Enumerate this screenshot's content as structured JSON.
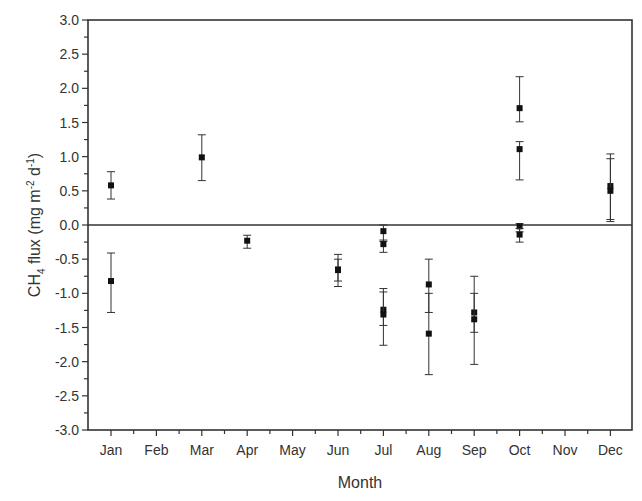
{
  "chart_data": {
    "type": "scatter",
    "title": "",
    "xlabel": "Month",
    "ylabel": "CH4 flux (mg m-2 d-1)",
    "ylabel_parts": {
      "main": "CH",
      "sub": "4",
      "rest": " flux (mg m",
      "sup1": "-2",
      "mid": " d",
      "sup2": "-1",
      "end": ")"
    },
    "categories": [
      "Jan",
      "Feb",
      "Mar",
      "Apr",
      "May",
      "Jun",
      "Jul",
      "Aug",
      "Sep",
      "Oct",
      "Nov",
      "Dec"
    ],
    "ylim": [
      -3.0,
      3.0
    ],
    "yticks": [
      "3.0",
      "2.5",
      "2.0",
      "1.5",
      "1.0",
      "0.5",
      "0.0",
      "-0.5",
      "-1.0",
      "-1.5",
      "-2.0",
      "-2.5",
      "-3.0"
    ],
    "grid": false,
    "zero_line": true,
    "legend": null,
    "marker": "square",
    "color": "#111111",
    "points": [
      {
        "month": "Jan",
        "y": 0.58,
        "err_low": 0.38,
        "err_high": 0.78
      },
      {
        "month": "Jan",
        "y": -0.82,
        "err_low": -1.28,
        "err_high": -0.41
      },
      {
        "month": "Mar",
        "y": 0.99,
        "err_low": 0.65,
        "err_high": 1.32
      },
      {
        "month": "Apr",
        "y": -0.23,
        "err_low": -0.34,
        "err_high": -0.15
      },
      {
        "month": "Jun",
        "y": -0.65,
        "err_low": -0.9,
        "err_high": -0.43
      },
      {
        "month": "Jun",
        "y": -0.66,
        "err_low": -0.82,
        "err_high": -0.5
      },
      {
        "month": "Jul",
        "y": -0.09,
        "err_low": -0.24,
        "err_high": 0.0
      },
      {
        "month": "Jul",
        "y": -0.28,
        "err_low": -0.4,
        "err_high": -0.22
      },
      {
        "month": "Jul",
        "y": -1.24,
        "err_low": -1.76,
        "err_high": -0.93
      },
      {
        "month": "Jul",
        "y": -1.31,
        "err_low": -1.47,
        "err_high": -0.98
      },
      {
        "month": "Aug",
        "y": -0.87,
        "err_low": -1.28,
        "err_high": -0.5
      },
      {
        "month": "Aug",
        "y": -1.59,
        "err_low": -2.19,
        "err_high": -1.0
      },
      {
        "month": "Sep",
        "y": -1.28,
        "err_low": -1.57,
        "err_high": -0.75
      },
      {
        "month": "Sep",
        "y": -1.38,
        "err_low": -2.04,
        "err_high": -1.0
      },
      {
        "month": "Oct",
        "y": 1.71,
        "err_low": 1.51,
        "err_high": 2.17
      },
      {
        "month": "Oct",
        "y": 1.11,
        "err_low": 0.66,
        "err_high": 1.22
      },
      {
        "month": "Oct",
        "y": -0.02,
        "err_low": -0.1,
        "err_high": 0.02
      },
      {
        "month": "Oct",
        "y": -0.14,
        "err_low": -0.25,
        "err_high": -0.05
      },
      {
        "month": "Dec",
        "y": 0.57,
        "err_low": 0.08,
        "err_high": 1.04
      },
      {
        "month": "Dec",
        "y": 0.5,
        "err_low": 0.05,
        "err_high": 0.97
      }
    ]
  },
  "layout": {
    "plot_left": 88,
    "plot_right": 632,
    "plot_top": 20,
    "plot_bottom": 430,
    "first_category_x": 111,
    "category_spacing": 45.4
  }
}
